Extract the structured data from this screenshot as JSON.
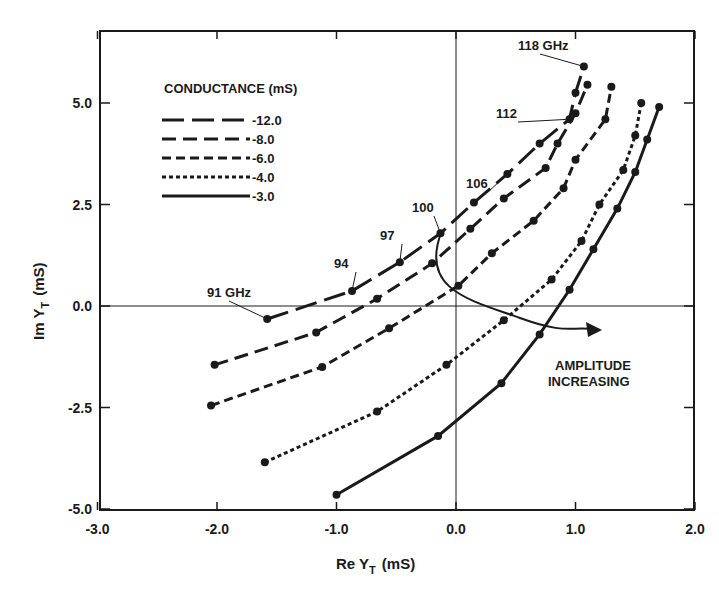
{
  "chart_data": {
    "type": "line",
    "title": "",
    "xlabel": "Re Y_T (mS)",
    "ylabel": "Im Y_T (mS)",
    "xlim": [
      -3.0,
      2.0
    ],
    "ylim": [
      -5.0,
      6.5
    ],
    "x_ticks": [
      "-3.0",
      "-2.0",
      "-1.0",
      "0.0",
      "1.0",
      "2.0"
    ],
    "y_ticks": [
      "5.0",
      "2.5",
      "0.0",
      "-2.5",
      "-5.0"
    ],
    "grid": false,
    "legend": {
      "title": "CONDUCTANCE (mS)",
      "position": "upper-left",
      "entries": [
        "-12.0",
        "-8.0",
        "-6.0",
        "-4.0",
        "-3.0"
      ]
    },
    "frequency_labels": [
      "91 GHz",
      "94",
      "97",
      "100",
      "106",
      "112",
      "118 GHz"
    ],
    "annotation": "AMPLITUDE INCREASING",
    "series": [
      {
        "name": "-12.0",
        "dash": "long",
        "points": [
          [
            -1.58,
            -0.32
          ],
          [
            -0.87,
            0.37
          ],
          [
            -0.47,
            1.08
          ],
          [
            -0.13,
            1.79
          ],
          [
            0.15,
            2.55
          ],
          [
            0.43,
            3.25
          ],
          [
            0.7,
            4.0
          ],
          [
            0.95,
            4.6
          ],
          [
            1.0,
            5.25
          ],
          [
            1.07,
            5.9
          ]
        ]
      },
      {
        "name": "-8.0",
        "dash": "medium",
        "points": [
          [
            -2.02,
            -1.45
          ],
          [
            -1.17,
            -0.65
          ],
          [
            -0.66,
            0.18
          ],
          [
            -0.2,
            1.05
          ],
          [
            0.12,
            1.9
          ],
          [
            0.4,
            2.65
          ],
          [
            0.75,
            3.4
          ],
          [
            0.85,
            4.0
          ],
          [
            1.0,
            4.75
          ],
          [
            1.1,
            5.45
          ]
        ]
      },
      {
        "name": "-6.0",
        "dash": "short",
        "points": [
          [
            -2.05,
            -2.45
          ],
          [
            -1.12,
            -1.5
          ],
          [
            -0.56,
            -0.55
          ],
          [
            0.02,
            0.5
          ],
          [
            0.3,
            1.3
          ],
          [
            0.65,
            2.1
          ],
          [
            0.9,
            2.9
          ],
          [
            1.0,
            3.6
          ],
          [
            1.25,
            4.6
          ],
          [
            1.3,
            5.4
          ]
        ]
      },
      {
        "name": "-4.0",
        "dash": "dotted",
        "points": [
          [
            -1.6,
            -3.85
          ],
          [
            -0.66,
            -2.6
          ],
          [
            -0.08,
            -1.45
          ],
          [
            0.4,
            -0.35
          ],
          [
            0.8,
            0.65
          ],
          [
            1.05,
            1.6
          ],
          [
            1.2,
            2.5
          ],
          [
            1.4,
            3.35
          ],
          [
            1.5,
            4.2
          ],
          [
            1.55,
            5.0
          ]
        ]
      },
      {
        "name": "-3.0",
        "dash": "solid",
        "points": [
          [
            -1.0,
            -4.65
          ],
          [
            -0.15,
            -3.2
          ],
          [
            0.38,
            -1.9
          ],
          [
            0.7,
            -0.7
          ],
          [
            0.95,
            0.4
          ],
          [
            1.15,
            1.4
          ],
          [
            1.35,
            2.4
          ],
          [
            1.5,
            3.3
          ],
          [
            1.6,
            4.1
          ],
          [
            1.7,
            4.9
          ]
        ]
      }
    ]
  },
  "axes": {
    "x_title_main": "Re  Y",
    "x_title_sub": "T",
    "x_title_unit": "(mS)",
    "y_title_main": "Im  Y",
    "y_title_sub": "T",
    "y_title_unit": "(mS)"
  }
}
